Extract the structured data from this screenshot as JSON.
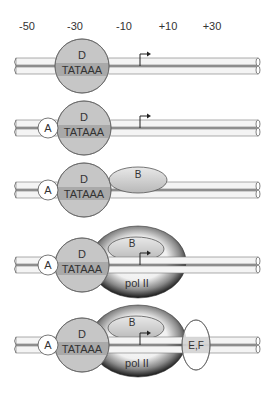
{
  "axis": {
    "positions": [
      "-50",
      "-30",
      "-10",
      "+10",
      "+30"
    ]
  },
  "factors": {
    "tfiid": "D",
    "tata": "TATAAA",
    "tfiia": "A",
    "tfiib": "B",
    "pol": "pol II",
    "tfiie_f": "E,F"
  },
  "steps": [
    {
      "step": 1,
      "components": [
        "D"
      ]
    },
    {
      "step": 2,
      "components": [
        "D",
        "A"
      ]
    },
    {
      "step": 3,
      "components": [
        "D",
        "A",
        "B"
      ]
    },
    {
      "step": 4,
      "components": [
        "D",
        "A",
        "B",
        "pol II"
      ]
    },
    {
      "step": 5,
      "components": [
        "D",
        "A",
        "B",
        "pol II",
        "E,F"
      ]
    }
  ],
  "colors": {
    "dna_fill": "#f4f4f4",
    "dna_stroke": "#555555",
    "tfiid_fill": "#c4c4c4",
    "tata_band": "#a8a8a8",
    "tfiia_fill": "#ffffff",
    "tfiib_fill": "#d4d4d4",
    "pol_dark": "#1a1a1a"
  }
}
